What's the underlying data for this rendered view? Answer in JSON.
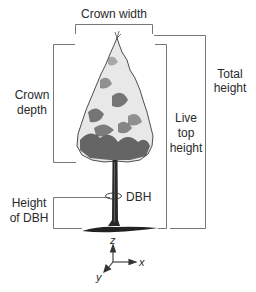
{
  "diagram": {
    "labels": {
      "crown_width": "Crown width",
      "crown_depth_line1": "Crown",
      "crown_depth_line2": "depth",
      "total_height_line1": "Total",
      "total_height_line2": "height",
      "live_top_line1": "Live",
      "live_top_line2": "top",
      "live_top_line3": "height",
      "dbh_height_line1": "Height",
      "dbh_height_line2": "of DBH",
      "dbh": "DBH"
    },
    "axes": {
      "x": "x",
      "y": "y",
      "z": "z"
    },
    "colors": {
      "line": "#555555",
      "ink": "#1a1a1a",
      "background": "#ffffff"
    }
  }
}
